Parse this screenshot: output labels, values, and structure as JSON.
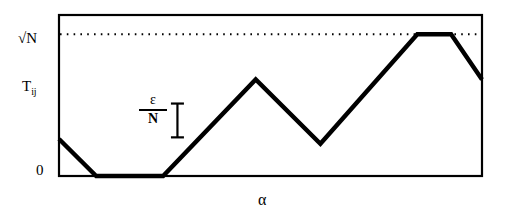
{
  "figure": {
    "title": "",
    "labels": {
      "y_top": "√N",
      "y_quantity": "T",
      "y_quantity_subscript": "ij",
      "y_zero": "0",
      "x_axis": "α",
      "annotation_numerator": "ε",
      "annotation_denominator": "N"
    },
    "colors": {
      "background": "#ffffff",
      "frame": "#000000",
      "curve": "#000000",
      "threshold_line": "#000000"
    }
  },
  "chart_data": {
    "type": "line",
    "title": "",
    "xlabel": "α",
    "ylabel": "T_ij",
    "xlim": [
      0,
      100
    ],
    "ylim": [
      0,
      100
    ],
    "grid": false,
    "legend": null,
    "axis_tick_labels": {
      "y": [
        "0",
        "√N"
      ],
      "x": []
    },
    "reference_lines": [
      {
        "name": "sqrt-N-threshold",
        "orientation": "horizontal",
        "value": 88,
        "label": "√N",
        "style": "dotted"
      }
    ],
    "annotations": [
      {
        "name": "epsilon-over-N-measure",
        "text": "ε/N",
        "kind": "i-beam-extent",
        "x": 28,
        "y_from": 24,
        "y_to": 45
      }
    ],
    "series": [
      {
        "name": "T_ij",
        "style": "thick-solid",
        "points": [
          {
            "x": 0,
            "y": 23
          },
          {
            "x": 8.8,
            "y": 0
          },
          {
            "x": 24.6,
            "y": 0
          },
          {
            "x": 46.5,
            "y": 60
          },
          {
            "x": 61.8,
            "y": 20
          },
          {
            "x": 84.7,
            "y": 88
          },
          {
            "x": 92.7,
            "y": 88
          },
          {
            "x": 100,
            "y": 60
          }
        ]
      }
    ]
  }
}
